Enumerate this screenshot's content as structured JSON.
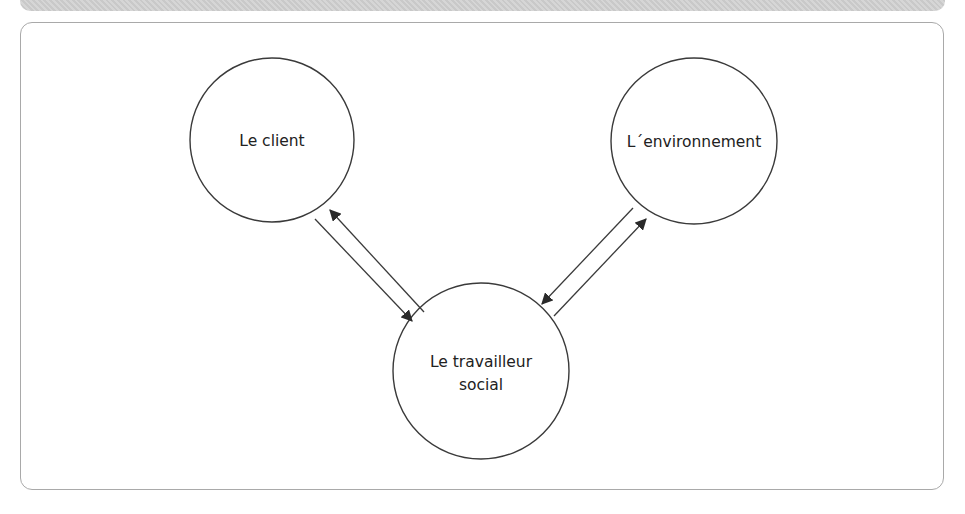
{
  "diagram": {
    "nodes": [
      {
        "id": "client",
        "label_lines": [
          "Le client"
        ],
        "cx": 272,
        "cy": 140,
        "r": 82
      },
      {
        "id": "environment",
        "label_lines": [
          "L´environnement"
        ],
        "cx": 694,
        "cy": 141,
        "r": 83
      },
      {
        "id": "social-worker",
        "label_lines": [
          "Le travailleur",
          "social"
        ],
        "cx": 481,
        "cy": 371,
        "r": 88
      }
    ],
    "edges": [
      {
        "from": "client",
        "to": "social-worker",
        "direction": "bidirectional",
        "style": "double-parallel-arrows"
      },
      {
        "from": "environment",
        "to": "social-worker",
        "direction": "bidirectional",
        "style": "double-parallel-arrows"
      }
    ],
    "colors": {
      "stroke": "#3a3a3a",
      "frame": "#a9a9a9",
      "band": "#cfcfcf",
      "text": "#222222"
    }
  }
}
